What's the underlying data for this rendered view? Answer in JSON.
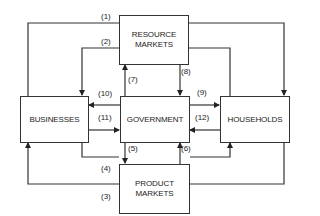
{
  "diagram": {
    "type": "circular-flow",
    "nodes": {
      "resource_markets": {
        "line1": "RESOURCE",
        "line2": "MARKETS"
      },
      "businesses": {
        "label": "BUSINESSES"
      },
      "government": {
        "label": "GOVERNMENT"
      },
      "households": {
        "label": "HOUSEHOLDS"
      },
      "product_markets": {
        "line1": "PRODUCT",
        "line2": "MARKETS"
      }
    },
    "flows": [
      {
        "id": "1",
        "label": "(1)",
        "from": "Businesses",
        "to": "Households",
        "via": "Resource Markets (outer top)"
      },
      {
        "id": "2",
        "label": "(2)",
        "from": "Households",
        "to": "Businesses",
        "via": "Resource Markets (inner top)"
      },
      {
        "id": "3",
        "label": "(3)",
        "from": "Households",
        "to": "Businesses",
        "via": "Product Markets (outer bottom)"
      },
      {
        "id": "4",
        "label": "(4)",
        "from": "Businesses",
        "to": "Households",
        "via": "Product Markets (inner bottom)"
      },
      {
        "id": "5",
        "label": "(5)",
        "from": "Government",
        "to": "Product Markets"
      },
      {
        "id": "6",
        "label": "(6)",
        "from": "Product Markets",
        "to": "Government"
      },
      {
        "id": "7",
        "label": "(7)",
        "from": "Government",
        "to": "Resource Markets"
      },
      {
        "id": "8",
        "label": "(8)",
        "from": "Resource Markets",
        "to": "Government"
      },
      {
        "id": "9",
        "label": "(9)",
        "from": "Government",
        "to": "Households"
      },
      {
        "id": "10",
        "label": "(10)",
        "from": "Government",
        "to": "Businesses"
      },
      {
        "id": "11",
        "label": "(11)",
        "from": "Businesses",
        "to": "Government"
      },
      {
        "id": "12",
        "label": "(12)",
        "from": "Households",
        "to": "Government"
      }
    ],
    "colors": {
      "line": "#333333",
      "text": "#222222",
      "background": "#ffffff"
    }
  }
}
